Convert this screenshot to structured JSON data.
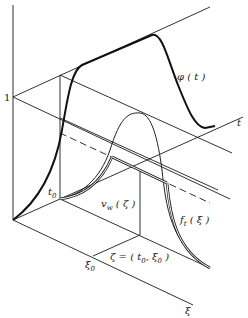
{
  "diagram": {
    "labels": {
      "one": "1",
      "t_axis": "t",
      "xi_axis": "ξ",
      "phi": "φ ( t )",
      "t0": "t",
      "t0_sub": "0",
      "xi0": "ξ",
      "xi0_sub": "0",
      "vw": "v",
      "vw_sub": "w",
      "vw_arg": " ( ζ )",
      "ft": "f",
      "ft_sub": "t",
      "ft_arg": " ( ξ )",
      "zeta": "ζ = ( t",
      "zeta_sub1": "0",
      "zeta_mid": ", ξ",
      "zeta_sub2": "0",
      "zeta_end": " )"
    },
    "stroke_color": "#1a1a1a",
    "background": "#ffffff"
  }
}
